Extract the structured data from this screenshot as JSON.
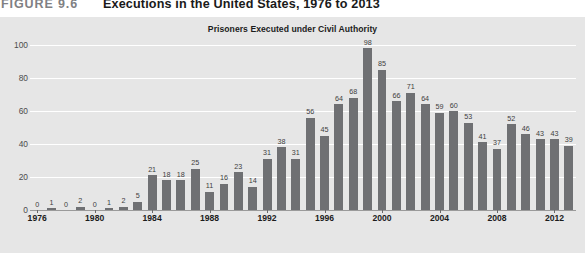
{
  "figure": {
    "label": "FIGURE 9.6",
    "title": "Executions in the United States, 1976 to 2013"
  },
  "colors": {
    "panel_background": "#e6e6e6",
    "bar_fill": "#6f7073",
    "gridline": "#ffffff",
    "axis": "#9a9a9a",
    "label_text": "#1c1c1c",
    "caption_label": "#7f8083"
  },
  "chart_data": {
    "type": "bar",
    "title": "Prisoners Executed under Civil Authority",
    "xlabel": "",
    "ylabel": "",
    "ylim": [
      0,
      100
    ],
    "yticks": [
      0,
      20,
      40,
      60,
      80,
      100
    ],
    "grid": true,
    "legend": "none",
    "xtick_labels": [
      "1976",
      "1980",
      "1984",
      "1988",
      "1992",
      "1996",
      "2000",
      "2004",
      "2008",
      "2012"
    ],
    "categories": [
      "1976",
      "1977",
      "1978",
      "1979",
      "1980",
      "1981",
      "1982",
      "1983",
      "1984",
      "1985",
      "1986",
      "1987",
      "1988",
      "1989",
      "1990",
      "1991",
      "1992",
      "1993",
      "1994",
      "1995",
      "1996",
      "1997",
      "1998",
      "1999",
      "2000",
      "2001",
      "2002",
      "2003",
      "2004",
      "2005",
      "2006",
      "2007",
      "2008",
      "2009",
      "2010",
      "2011",
      "2012",
      "2013"
    ],
    "values": [
      0,
      1,
      0,
      2,
      0,
      1,
      2,
      5,
      21,
      18,
      18,
      25,
      11,
      16,
      23,
      14,
      31,
      38,
      31,
      56,
      45,
      64,
      68,
      98,
      85,
      66,
      71,
      64,
      59,
      60,
      53,
      41,
      37,
      52,
      46,
      43,
      43,
      39
    ]
  }
}
